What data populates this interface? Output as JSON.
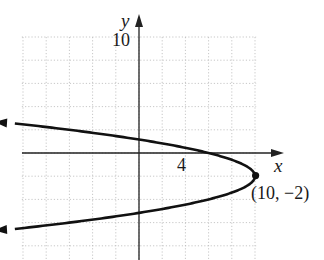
{
  "chart_data": {
    "type": "line",
    "title": "",
    "xlabel": "x",
    "ylabel": "y",
    "equation": "x = -(y + 2)^2 + 10",
    "grid": true,
    "grid_step": 2,
    "xlim": [
      -12,
      10
    ],
    "ylim": [
      -10,
      10
    ],
    "tick_labels": {
      "x": [
        "4"
      ],
      "y": [
        "10"
      ]
    },
    "series": [
      {
        "name": "parabola",
        "opens": "left",
        "vertex": [
          10,
          -2
        ],
        "points": [
          [
            -11.6,
            2.65
          ],
          [
            -6,
            2
          ],
          [
            0,
            1.16
          ],
          [
            4,
            0.45
          ],
          [
            6,
            0
          ],
          [
            8,
            -0.59
          ],
          [
            9,
            -1
          ],
          [
            10,
            -2
          ],
          [
            9,
            -3
          ],
          [
            8,
            -3.41
          ],
          [
            6,
            -4
          ],
          [
            0,
            -5.16
          ],
          [
            -6,
            -6
          ],
          [
            -11.6,
            -6.65
          ]
        ]
      }
    ],
    "annotations": [
      {
        "text": "(10, −2)",
        "x": 10,
        "y": -2,
        "marker": "filled-dot"
      }
    ]
  },
  "labels": {
    "x_axis": "x",
    "y_axis": "y",
    "y_tick": "10",
    "x_tick": "4",
    "vertex": "(10, −2)"
  }
}
